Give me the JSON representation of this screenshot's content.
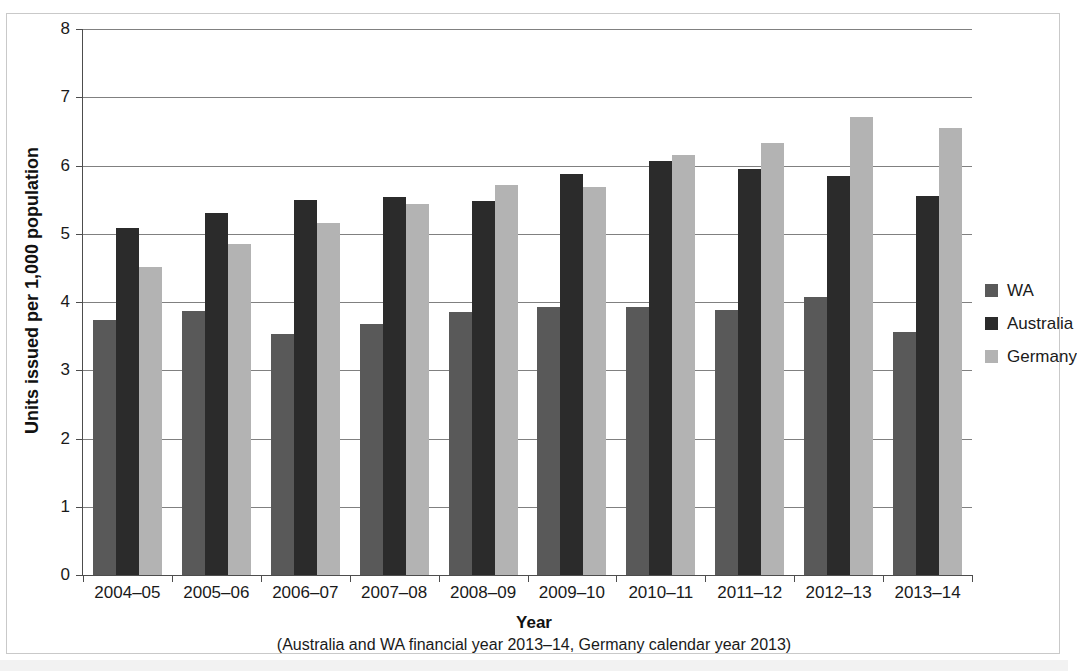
{
  "chart_data": {
    "type": "bar",
    "title": "",
    "xlabel": "Year",
    "ylabel": "Units issued per 1,000 population",
    "xnote": "(Australia and WA financial year 2013–14, Germany calendar year 2013)",
    "categories": [
      "2004–05",
      "2005–06",
      "2006–07",
      "2007–08",
      "2008–09",
      "2009–10",
      "2010–11",
      "2011–12",
      "2012–13",
      "2013–14"
    ],
    "series": [
      {
        "name": "WA",
        "color": "#595959",
        "values": [
          3.73,
          3.87,
          3.53,
          3.68,
          3.85,
          3.93,
          3.92,
          3.88,
          4.08,
          3.56
        ]
      },
      {
        "name": "Australia",
        "color": "#2b2b2b",
        "values": [
          5.08,
          5.31,
          5.49,
          5.54,
          5.48,
          5.88,
          6.06,
          5.95,
          5.85,
          5.56
        ]
      },
      {
        "name": "Germany",
        "color": "#b3b3b3",
        "values": [
          4.52,
          4.85,
          5.16,
          5.43,
          5.72,
          5.68,
          6.16,
          6.33,
          6.71,
          6.55
        ]
      }
    ],
    "ylim": [
      0,
      8
    ],
    "yticks": [
      0,
      1,
      2,
      3,
      4,
      5,
      6,
      7,
      8
    ],
    "ytick_labels": [
      "0",
      "1",
      "2",
      "3",
      "4",
      "5",
      "6",
      "7",
      "8"
    ],
    "grid": true,
    "legend_position": "right"
  },
  "legend": {
    "items": [
      {
        "label": "WA",
        "color": "#595959"
      },
      {
        "label": "Australia",
        "color": "#2b2b2b"
      },
      {
        "label": "Germany",
        "color": "#b3b3b3"
      }
    ]
  }
}
